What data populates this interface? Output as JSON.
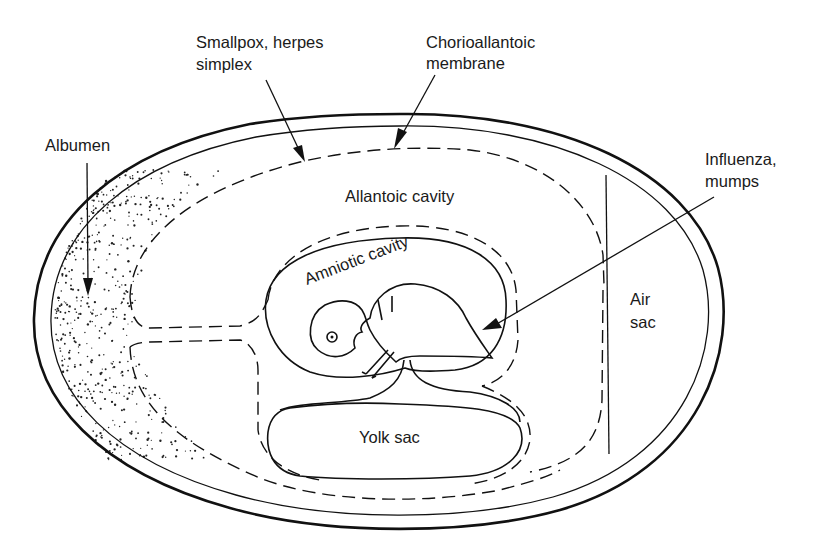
{
  "figure": {
    "labels": {
      "albumen": "Albumen",
      "smallpox_line1": "Smallpox, herpes",
      "smallpox_line2": "simplex",
      "chorio_line1": "Chorioallantoic",
      "chorio_line2": "membrane",
      "influenza_line1": "Influenza,",
      "influenza_line2": "mumps",
      "allantoic_cavity": "Allantoic cavity",
      "amniotic_cavity": "Amniotic cavity",
      "air_line1": "Air",
      "air_line2": "sac",
      "yolk_sac": "Yolk sac"
    },
    "annotations": [
      {
        "label": "Albumen",
        "points_to": "albumen layer (stippled)"
      },
      {
        "label": "Smallpox, herpes simplex",
        "points_to": "chorioallantoic membrane surface"
      },
      {
        "label": "Chorioallantoic membrane",
        "points_to": "dashed chorioallantoic boundary"
      },
      {
        "label": "Influenza, mumps",
        "points_to": "amniotic cavity"
      }
    ],
    "colors": {
      "ink": "#111111",
      "background": "#ffffff"
    }
  }
}
